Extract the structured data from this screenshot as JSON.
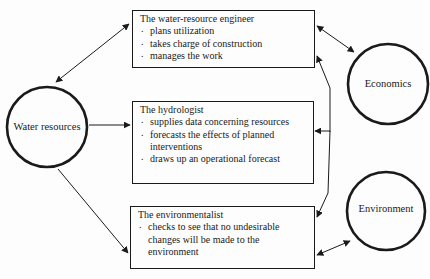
{
  "nodes": {
    "water_resources": {
      "label": "Water resources"
    },
    "economics": {
      "label": "Economics"
    },
    "environment": {
      "label": "Environment"
    }
  },
  "roles": [
    {
      "title": "The water-resource engineer",
      "duties": [
        "plans utilization",
        "takes charge of construction",
        "manages the work"
      ]
    },
    {
      "title": "The hydrologist",
      "duties": [
        "supplies data concerning resources",
        "forecasts the effects of planned interventions",
        "draws up an operational forecast"
      ]
    },
    {
      "title": "The environmentalist",
      "duties": [
        "checks to see that no undesirable changes will be made to the environment"
      ]
    }
  ],
  "edges": [
    {
      "from": "The water-resource engineer",
      "to": "Water resources",
      "direction": "both"
    },
    {
      "from": "Water resources",
      "to": "The hydrologist",
      "direction": "forward"
    },
    {
      "from": "Water resources",
      "to": "The environmentalist",
      "direction": "forward"
    },
    {
      "from": "The water-resource engineer",
      "to": "Economics",
      "direction": "both"
    },
    {
      "from": "The environmentalist",
      "to": "Environment",
      "direction": "both"
    },
    {
      "from": "connector",
      "to": [
        "The water-resource engineer",
        "The hydrologist",
        "The environmentalist"
      ],
      "direction": "forward"
    }
  ]
}
